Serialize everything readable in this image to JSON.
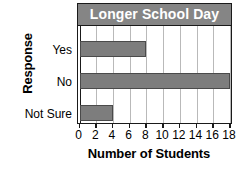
{
  "chart_data": {
    "type": "bar",
    "orientation": "horizontal",
    "title": "Longer School Day",
    "xlabel": "Number of Students",
    "ylabel": "Response",
    "categories": [
      "Yes",
      "No",
      "Not Sure"
    ],
    "values": [
      8,
      18,
      4
    ],
    "series": [
      {
        "name": "Number of Students",
        "values": [
          8,
          18,
          4
        ]
      }
    ],
    "xlim": [
      0,
      18
    ],
    "xticks": [
      0,
      2,
      4,
      6,
      8,
      10,
      12,
      14,
      16,
      18
    ],
    "xtick_labels": [
      "0",
      "2",
      "4",
      "6",
      "8",
      "10",
      "12",
      "14",
      "16",
      "18"
    ],
    "grid": "vertical",
    "legend": "none",
    "colors": {
      "bar": "#7d7d7d",
      "bar_border": "#4a4a4a",
      "title_banner": "#858585",
      "title_text": "#ffffff",
      "gridline": "#b9b9b9",
      "axis": "#1a1a1a",
      "background": "#ffffff"
    }
  }
}
